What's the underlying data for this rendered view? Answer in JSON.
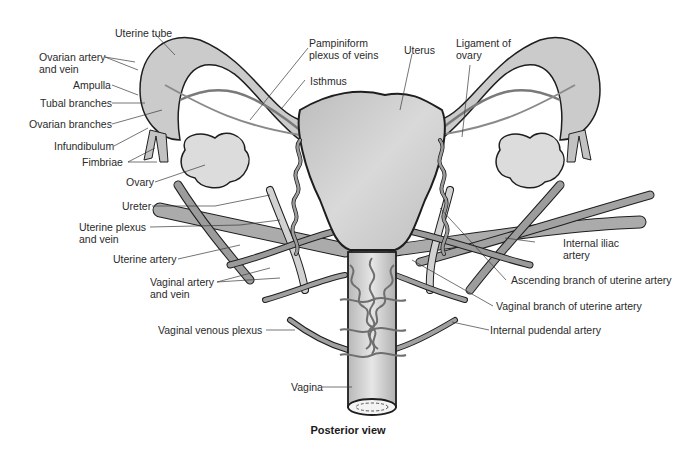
{
  "figure": {
    "caption": "Posterior view",
    "colors": {
      "background": "#ffffff",
      "organ_fill": "#cfcfcf",
      "organ_stroke": "#1e1e1e",
      "vessel_fill": "#a9a9a9",
      "vessel_dark": "#7a7a7a",
      "leader_line": "#3a3a3a",
      "label_text": "#2a2a2a"
    },
    "labels_left": [
      {
        "id": "uterine-tube",
        "text": "Uterine tube"
      },
      {
        "id": "ovarian-artery-vein",
        "line1": "Ovarian artery",
        "line2": "and vein"
      },
      {
        "id": "ampulla",
        "text": "Ampulla"
      },
      {
        "id": "tubal-branches",
        "text": "Tubal branches"
      },
      {
        "id": "ovarian-branches",
        "text": "Ovarian branches"
      },
      {
        "id": "infundibulum",
        "text": "Infundibulum"
      },
      {
        "id": "fimbriae",
        "text": "Fimbriae"
      },
      {
        "id": "ovary",
        "text": "Ovary"
      },
      {
        "id": "ureter",
        "text": "Ureter"
      },
      {
        "id": "uterine-plexus-vein",
        "line1": "Uterine plexus",
        "line2": "and vein"
      },
      {
        "id": "uterine-artery",
        "text": "Uterine artery"
      },
      {
        "id": "vaginal-artery-vein",
        "line1": "Vaginal artery",
        "line2": "and vein"
      },
      {
        "id": "vaginal-venous-plexus",
        "text": "Vaginal venous plexus"
      },
      {
        "id": "vagina",
        "text": "Vagina"
      }
    ],
    "labels_top": [
      {
        "id": "pampiniform-plexus",
        "line1": "Pampiniform",
        "line2": "plexus of veins"
      },
      {
        "id": "isthmus",
        "text": "Isthmus"
      },
      {
        "id": "uterus",
        "text": "Uterus"
      },
      {
        "id": "ligament-of-ovary",
        "line1": "Ligament of",
        "line2": "ovary"
      }
    ],
    "labels_right": [
      {
        "id": "internal-iliac-artery",
        "line1": "Internal iliac",
        "line2": "artery"
      },
      {
        "id": "ascending-branch",
        "text": "Ascending branch of uterine artery"
      },
      {
        "id": "vaginal-branch",
        "text": "Vaginal branch of uterine artery"
      },
      {
        "id": "internal-pudendal-artery",
        "text": "Internal pudendal artery"
      }
    ]
  }
}
